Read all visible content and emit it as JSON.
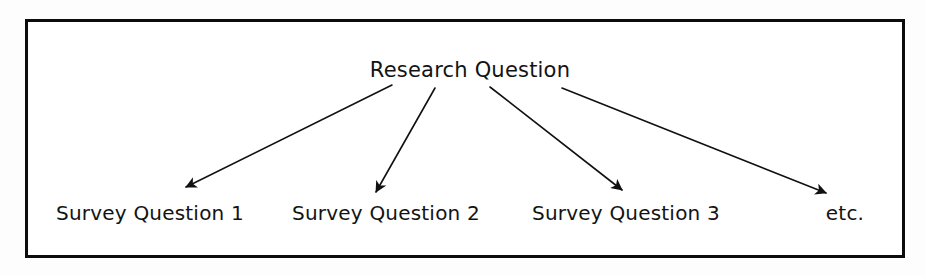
{
  "diagram": {
    "type": "tree",
    "frame": {
      "border_color": "#0c0c0c",
      "background_color": "#ffffff",
      "border_width_px": 3
    },
    "root": {
      "label": "Research Question",
      "center_x": 470,
      "baseline_y": 78
    },
    "leaves": [
      {
        "label": "Survey Question 1",
        "center_x": 150,
        "baseline_y": 220
      },
      {
        "label": "Survey Question 2",
        "center_x": 386,
        "baseline_y": 220
      },
      {
        "label": "Survey Question 3",
        "center_x": 626,
        "baseline_y": 220
      },
      {
        "label": "etc.",
        "center_x": 845,
        "baseline_y": 220
      }
    ],
    "arrows": [
      {
        "name": "arrow-to-survey-question-1",
        "x1": 392,
        "y1": 85,
        "x2": 186,
        "y2": 187
      },
      {
        "name": "arrow-to-survey-question-2",
        "x1": 435,
        "y1": 88,
        "x2": 376,
        "y2": 192
      },
      {
        "name": "arrow-to-survey-question-3",
        "x1": 490,
        "y1": 87,
        "x2": 622,
        "y2": 190
      },
      {
        "name": "arrow-to-etc",
        "x1": 562,
        "y1": 88,
        "x2": 826,
        "y2": 193
      }
    ],
    "line_color": "#111111",
    "line_width_px": 1.6
  }
}
